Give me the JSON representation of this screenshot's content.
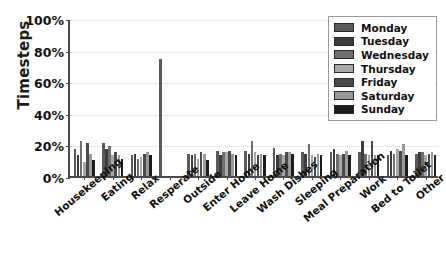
{
  "chart_data": {
    "type": "bar",
    "title": "",
    "xlabel": "",
    "ylabel": "Timesteps",
    "ylim": [
      0,
      100
    ],
    "yticks": [
      "0%",
      "20%",
      "40%",
      "60%",
      "80%",
      "100%"
    ],
    "ytick_values": [
      0,
      20,
      40,
      60,
      80,
      100
    ],
    "grid": true,
    "legend_position": "upper right",
    "categories": [
      "Housekeeping",
      "Eating",
      "Relax",
      "Resperate",
      "Outside",
      "Enter Home",
      "Leave Home",
      "Wash Dishes",
      "Sleeping",
      "Meal Preparation",
      "Work",
      "Bed to Toilet",
      "Other"
    ],
    "series": [
      {
        "name": "Monday",
        "color": "#5a5a5a",
        "values": [
          17,
          21,
          13,
          74,
          14,
          16,
          16,
          18,
          15,
          15,
          15,
          13,
          14
        ]
      },
      {
        "name": "Tuesday",
        "color": "#3c3c3c",
        "values": [
          13,
          17,
          14,
          0,
          13,
          13,
          14,
          13,
          14,
          17,
          22,
          16,
          15
        ]
      },
      {
        "name": "Wednesday",
        "color": "#6e6e6e",
        "values": [
          22,
          19,
          11,
          0,
          14,
          15,
          22,
          14,
          20,
          14,
          14,
          14,
          15
        ]
      },
      {
        "name": "Thursday",
        "color": "#a8a8a8",
        "values": [
          9,
          13,
          12,
          0,
          11,
          15,
          15,
          13,
          13,
          13,
          13,
          17,
          13
        ]
      },
      {
        "name": "Friday",
        "color": "#4a4a4a",
        "values": [
          21,
          15,
          14,
          0,
          15,
          16,
          13,
          15,
          12,
          14,
          22,
          16,
          14
        ]
      },
      {
        "name": "Saturday",
        "color": "#9a9a9a",
        "values": [
          14,
          13,
          15,
          0,
          14,
          14,
          14,
          15,
          14,
          16,
          13,
          20,
          15
        ]
      },
      {
        "name": "Sunday",
        "color": "#1c1c1c",
        "values": [
          10,
          11,
          13,
          0,
          10,
          13,
          13,
          14,
          13,
          13,
          13,
          13,
          13
        ]
      }
    ]
  },
  "legend": {
    "items": [
      "Monday",
      "Tuesday",
      "Wednesday",
      "Thursday",
      "Friday",
      "Saturday",
      "Sunday"
    ]
  }
}
